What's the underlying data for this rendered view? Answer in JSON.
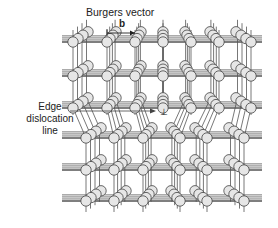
{
  "diagram": {
    "title": "Burgers vector",
    "burgers_symbol": "b",
    "edge_label_lines": [
      "Edge",
      "dislocation",
      "line"
    ],
    "dislocation_symbol": "⊥",
    "colors": {
      "atom_fill": "#e6e6e6",
      "atom_stroke": "#444444",
      "bond": "#555555",
      "bond_dark": "#333333",
      "text": "#222222"
    },
    "lattice": {
      "upper_columns": 7,
      "lower_columns": 6,
      "upper_rows": 3,
      "lower_rows": 3,
      "depth_atoms": 4,
      "extra_half_plane_column": 3
    }
  }
}
